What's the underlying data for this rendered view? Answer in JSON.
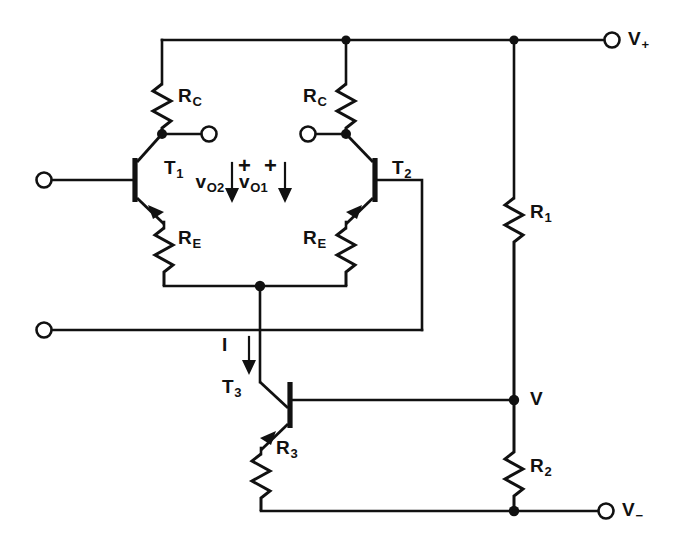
{
  "figure": {
    "type": "circuit-schematic",
    "background_color": "#ffffff",
    "line_color": "#111111"
  },
  "labels": {
    "rc_left": "R",
    "rc_left_sub": "C",
    "rc_right": "R",
    "rc_right_sub": "C",
    "re_left": "R",
    "re_left_sub": "E",
    "re_right": "R",
    "re_right_sub": "E",
    "t1": "T",
    "t1_sub": "1",
    "t2": "T",
    "t2_sub": "2",
    "t3": "T",
    "t3_sub": "3",
    "r1": "R",
    "r1_sub": "1",
    "r2": "R",
    "r2_sub": "2",
    "r3": "R",
    "r3_sub": "3",
    "vo1": "v",
    "vo1_sub": "O1",
    "vo2": "v",
    "vo2_sub": "O2",
    "current_i": "I",
    "v_node": "V",
    "v_plus": "V",
    "v_plus_sub": "+",
    "v_minus": "V",
    "v_minus_sub": "−",
    "polarity_left": "+",
    "polarity_right": "+"
  },
  "components": [
    {
      "name": "RC-left",
      "type": "resistor",
      "label": "R_C",
      "orientation": "vertical"
    },
    {
      "name": "RC-right",
      "type": "resistor",
      "label": "R_C",
      "orientation": "vertical"
    },
    {
      "name": "RE-left",
      "type": "resistor",
      "label": "R_E",
      "orientation": "vertical"
    },
    {
      "name": "RE-right",
      "type": "resistor",
      "label": "R_E",
      "orientation": "vertical"
    },
    {
      "name": "R1",
      "type": "resistor",
      "label": "R_1",
      "orientation": "vertical"
    },
    {
      "name": "R2",
      "type": "resistor",
      "label": "R_2",
      "orientation": "vertical"
    },
    {
      "name": "R3",
      "type": "resistor",
      "label": "R_3",
      "orientation": "vertical"
    },
    {
      "name": "T1",
      "type": "transistor",
      "label": "T_1",
      "device": "npn"
    },
    {
      "name": "T2",
      "type": "transistor",
      "label": "T_2",
      "device": "npn"
    },
    {
      "name": "T3",
      "type": "transistor",
      "label": "T_3",
      "device": "npn"
    }
  ],
  "terminals": [
    {
      "name": "input-left",
      "label": "",
      "position": "left-upper"
    },
    {
      "name": "input-left-lower",
      "label": "",
      "position": "left-lower"
    },
    {
      "name": "output-vo1",
      "label": "",
      "position": "center-left"
    },
    {
      "name": "output-vo2",
      "label": "",
      "position": "center-right"
    },
    {
      "name": "supply-positive",
      "label": "V+",
      "position": "right-top"
    },
    {
      "name": "supply-negative",
      "label": "V−",
      "position": "right-bottom"
    }
  ],
  "annotations": [
    {
      "name": "vo1-arrow",
      "label": "v_O1",
      "polarity": "+",
      "direction": "down"
    },
    {
      "name": "vo2-arrow",
      "label": "v_O2",
      "polarity": "+",
      "direction": "down"
    },
    {
      "name": "current-arrow",
      "label": "I",
      "direction": "down"
    },
    {
      "name": "node-v",
      "label": "V"
    }
  ]
}
